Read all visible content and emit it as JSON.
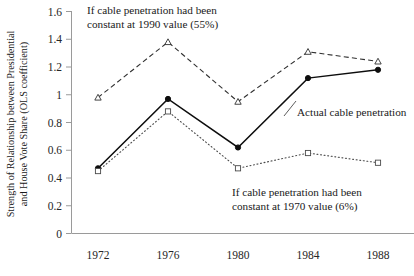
{
  "chart_data": {
    "type": "line",
    "title": "",
    "xlabel": "",
    "ylabel_line1": "Strength of Relationship between Presidential",
    "ylabel_line2": "and House Vote Share (OLS coefficient)",
    "categories": [
      "1972",
      "1976",
      "1980",
      "1984",
      "1988"
    ],
    "x": [
      1972,
      1976,
      1980,
      1984,
      1988
    ],
    "ylim": [
      0,
      1.6
    ],
    "yticks": [
      "0",
      "0.2",
      "0.4",
      "0.6",
      "0.8",
      "1",
      "1.2",
      "1.4",
      "1.6"
    ],
    "ytick_values": [
      0,
      0.2,
      0.4,
      0.6,
      0.8,
      1.0,
      1.2,
      1.4,
      1.6
    ],
    "grid": false,
    "legend_position": "inline-annotations",
    "series": [
      {
        "name": "If cable penetration had been constant at 1990 value (55%)",
        "values": [
          0.98,
          1.38,
          0.95,
          1.31,
          1.24
        ],
        "line_style": "dashed",
        "marker": "triangle",
        "color": "#303030"
      },
      {
        "name": "Actual cable penetration",
        "values": [
          0.47,
          0.97,
          0.62,
          1.12,
          1.18
        ],
        "line_style": "solid",
        "marker": "circle",
        "color": "#0d0d0d"
      },
      {
        "name": "If cable penetration had been constant at 1970 value (6%)",
        "values": [
          0.45,
          0.88,
          0.47,
          0.58,
          0.51
        ],
        "line_style": "dotted",
        "marker": "square",
        "color": "#4a4a4a"
      }
    ],
    "annotations": [
      {
        "id": "annotation-1990",
        "line1": "If cable penetration had been",
        "line2": "constant at 1990 value (55%)",
        "x": 87,
        "y": 14
      },
      {
        "id": "annotation-actual",
        "line1": "Actual cable penetration",
        "line2": "",
        "x": 297,
        "y": 112
      },
      {
        "id": "annotation-1970",
        "line1": "If cable penetration had been",
        "line2": "constant at 1970 value (6%)",
        "x": 232,
        "y": 192
      }
    ]
  },
  "axis": {
    "y_ticks": [
      {
        "label": "1.6",
        "value": 1.6
      },
      {
        "label": "1.4",
        "value": 1.4
      },
      {
        "label": "1.2",
        "value": 1.2
      },
      {
        "label": "1",
        "value": 1.0
      },
      {
        "label": "0.8",
        "value": 0.8
      },
      {
        "label": "0.6",
        "value": 0.6
      },
      {
        "label": "0.4",
        "value": 0.4
      },
      {
        "label": "0.2",
        "value": 0.2
      },
      {
        "label": "0",
        "value": 0
      }
    ],
    "x_ticks": [
      {
        "label": "1972"
      },
      {
        "label": "1976"
      },
      {
        "label": "1980"
      },
      {
        "label": "1984"
      },
      {
        "label": "1988"
      }
    ]
  }
}
